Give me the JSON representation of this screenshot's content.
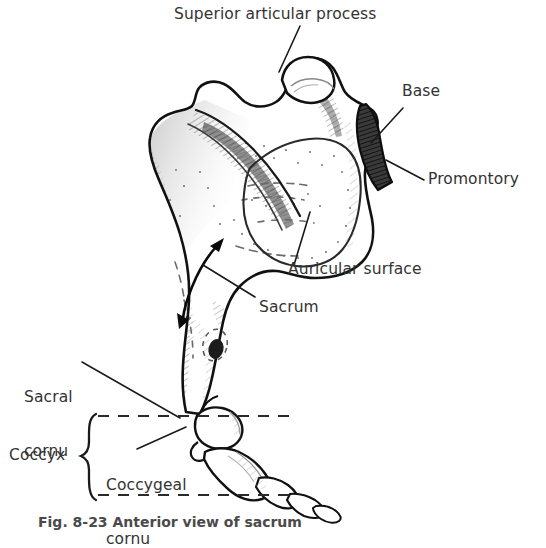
{
  "figure": {
    "background_color": "#ffffff",
    "ink_color": "#1a1a1a",
    "text_color": "#333333",
    "shading_color": "#555555",
    "promontory_fill": "#2b2b2b"
  },
  "labels": {
    "superior_articular_process": "Superior articular process",
    "base": "Base",
    "promontory": "Promontory",
    "auricular_surface": "Auricular surface",
    "sacrum": "Sacrum",
    "sacral_cornu_line1": "Sacral",
    "sacral_cornu_line2": "cornu",
    "coccyx": "Coccyx",
    "coccygeal_cornu_line1": "Coccygeal",
    "coccygeal_cornu_line2": "cornu"
  },
  "caption": {
    "text": "Fig. 8-23 Anterior view of sacrum"
  },
  "annotations": {
    "sacrum_extent_arrow": "double-headed-arrow",
    "coccyx_bracket": "curly-brace",
    "coccyx_region_box": "dashed-rectangle"
  }
}
